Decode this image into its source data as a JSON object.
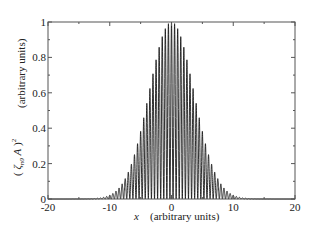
{
  "chart_data": {
    "type": "line",
    "title": "",
    "xlabel": "x   (arbitrary units)",
    "xlabel_var": "x",
    "xlabel_units": "(arbitrary units)",
    "ylabel": "(ζn0 A)^2   (arbitrary units)",
    "ylabel_units": "(arbitrary units)",
    "xlim": [
      -20,
      20
    ],
    "ylim": [
      0,
      1
    ],
    "xticks": [
      -20,
      -10,
      0,
      10,
      20
    ],
    "yticks": [
      0,
      0.2,
      0.4,
      0.6,
      0.8,
      1
    ],
    "xtick_labels": [
      "-20",
      "-10",
      "0",
      "10",
      "20"
    ],
    "ytick_labels": [
      "0",
      "0.2",
      "0.4",
      "0.6",
      "0.8",
      "1"
    ],
    "grid": false,
    "legend": null,
    "line_color": "#1a1a1a",
    "model": {
      "envelope": "exp(-x^2/26)",
      "carrier": "cos^2(2*pi*x)",
      "peak_spacing": 0.5
    },
    "series": [
      {
        "name": "(ζn0 A)^2",
        "envelope_samples": {
          "x": [
            -12,
            -10,
            -8,
            -6,
            -4,
            -2,
            0,
            2,
            4,
            6,
            8,
            10,
            12
          ],
          "y": [
            0.004,
            0.021,
            0.085,
            0.25,
            0.54,
            0.86,
            1.0,
            0.86,
            0.54,
            0.25,
            0.085,
            0.021,
            0.004
          ]
        }
      }
    ]
  }
}
